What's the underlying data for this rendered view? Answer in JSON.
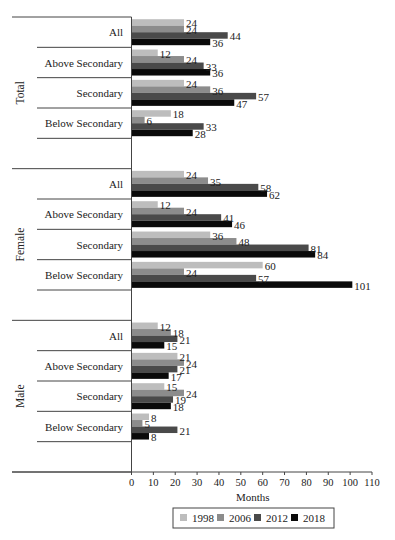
{
  "chart_data": {
    "type": "bar",
    "orientation": "horizontal",
    "title": "",
    "xlabel": "Months",
    "ylabel": "",
    "xlim": [
      0,
      110
    ],
    "xticks": [
      0,
      10,
      20,
      30,
      40,
      50,
      60,
      70,
      80,
      90,
      100,
      110
    ],
    "grid": false,
    "legend_position": "bottom-center",
    "series_names": [
      "1998",
      "2006",
      "2012",
      "2018"
    ],
    "series_colors": [
      "#bdbdbd",
      "#8c8c8c",
      "#4a4a4a",
      "#0a0a0a"
    ],
    "sections": [
      {
        "name": "Total",
        "groups": [
          {
            "label": "All",
            "values": [
              24,
              24,
              44,
              36
            ]
          },
          {
            "label": "Above Secondary",
            "values": [
              12,
              24,
              33,
              36
            ]
          },
          {
            "label": "Secondary",
            "values": [
              24,
              36,
              57,
              47
            ]
          },
          {
            "label": "Below Secondary",
            "values": [
              18,
              6,
              33,
              28
            ]
          }
        ]
      },
      {
        "name": "Female",
        "groups": [
          {
            "label": "All",
            "values": [
              24,
              35,
              58,
              62
            ]
          },
          {
            "label": "Above Secondary",
            "values": [
              12,
              24,
              41,
              46
            ]
          },
          {
            "label": "Secondary",
            "values": [
              36,
              48,
              81,
              84
            ]
          },
          {
            "label": "Below Secondary",
            "values": [
              60,
              24,
              57,
              101
            ]
          }
        ]
      },
      {
        "name": "Male",
        "groups": [
          {
            "label": "All",
            "values": [
              12,
              18,
              21,
              15
            ]
          },
          {
            "label": "Above Secondary",
            "values": [
              21,
              24,
              21,
              17
            ]
          },
          {
            "label": "Secondary",
            "values": [
              15,
              24,
              19,
              18
            ]
          },
          {
            "label": "Below Secondary",
            "values": [
              8,
              5,
              21,
              8
            ]
          }
        ]
      }
    ]
  }
}
